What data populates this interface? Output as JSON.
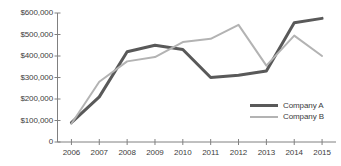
{
  "chart_data": {
    "type": "line",
    "title": "",
    "xlabel": "",
    "ylabel": "",
    "categories": [
      "2006",
      "2007",
      "2008",
      "2009",
      "2010",
      "2011",
      "2012",
      "2013",
      "2014",
      "2015"
    ],
    "ylim": [
      0,
      600000
    ],
    "ytick_values": [
      600000,
      500000,
      400000,
      300000,
      200000,
      100000,
      0
    ],
    "ytick_labels": [
      "$600,000",
      "$500,000",
      "$400,000",
      "$300,000",
      "$200,000",
      "$100,000",
      "0"
    ],
    "grid": false,
    "legend_position": "inside-bottom-right",
    "series": [
      {
        "name": "Company A",
        "color": "#595959",
        "line_width": 3,
        "values": [
          90000,
          210000,
          420000,
          450000,
          430000,
          300000,
          310000,
          330000,
          555000,
          575000
        ]
      },
      {
        "name": "Company B",
        "color": "#b3b3b3",
        "line_width": 2,
        "values": [
          85000,
          280000,
          375000,
          395000,
          465000,
          480000,
          545000,
          355000,
          495000,
          400000
        ]
      }
    ],
    "axis_color": "#808080"
  }
}
